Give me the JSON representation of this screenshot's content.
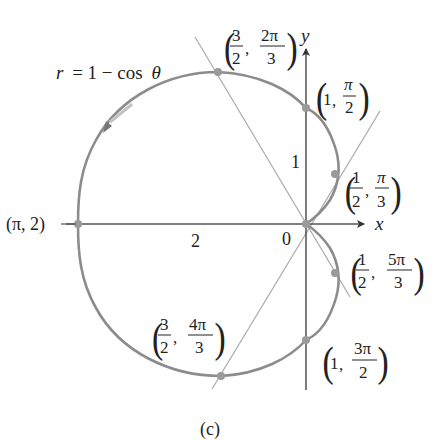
{
  "figure": {
    "equation_label": "r = 1 − cos θ",
    "equation_parts": {
      "r": "r",
      "eq": "= 1 − cos",
      "theta": "θ"
    },
    "caption": "(c)",
    "axes": {
      "x_label": "x",
      "y_label": "y",
      "origin_label": "0"
    },
    "tick_labels": {
      "y_one": "1",
      "x_two": "2"
    },
    "colors": {
      "curve": "#8c8c8c",
      "axis": "#333333",
      "line": "#a8a8a8",
      "point": "#9a9a9a",
      "text": "#222222"
    },
    "points": [
      {
        "id": "pi-2",
        "r": "2",
        "theta": "π",
        "label": "(π, 2)"
      },
      {
        "id": "1-pi-2",
        "r_text": "1",
        "theta_num": "π",
        "theta_den": "2"
      },
      {
        "id": "3-2-2pi-3",
        "r_num": "3",
        "r_den": "2",
        "theta_num": "2π",
        "theta_den": "3"
      },
      {
        "id": "1-2-pi-3",
        "r_num": "1",
        "r_den": "2",
        "theta_num": "π",
        "theta_den": "3"
      },
      {
        "id": "1-2-5pi-3",
        "r_num": "1",
        "r_den": "2",
        "theta_num": "5π",
        "theta_den": "3"
      },
      {
        "id": "3-2-4pi-3",
        "r_num": "3",
        "r_den": "2",
        "theta_num": "4π",
        "theta_den": "3"
      },
      {
        "id": "1-3pi-2",
        "r_text": "1",
        "theta_num": "3π",
        "theta_den": "2"
      }
    ],
    "comma": ","
  }
}
